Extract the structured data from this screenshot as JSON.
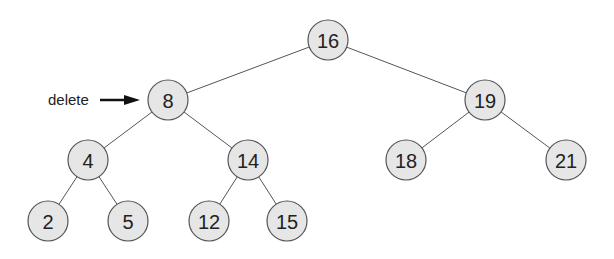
{
  "diagram": {
    "type": "binary-search-tree",
    "node_radius": 20,
    "colors": {
      "node_fill": "#e6e6e6",
      "node_stroke": "#555555",
      "edge": "#555555",
      "text": "#222222",
      "arrow": "#111111"
    },
    "nodes": [
      {
        "id": "n16",
        "label": "16",
        "x": 328,
        "y": 40
      },
      {
        "id": "n8",
        "label": "8",
        "x": 168,
        "y": 100
      },
      {
        "id": "n19",
        "label": "19",
        "x": 485,
        "y": 100
      },
      {
        "id": "n4",
        "label": "4",
        "x": 88,
        "y": 160
      },
      {
        "id": "n14",
        "label": "14",
        "x": 248,
        "y": 160
      },
      {
        "id": "n18",
        "label": "18",
        "x": 406,
        "y": 160
      },
      {
        "id": "n21",
        "label": "21",
        "x": 566,
        "y": 160
      },
      {
        "id": "n2",
        "label": "2",
        "x": 48,
        "y": 221
      },
      {
        "id": "n5",
        "label": "5",
        "x": 128,
        "y": 221
      },
      {
        "id": "n12",
        "label": "12",
        "x": 209,
        "y": 221
      },
      {
        "id": "n15",
        "label": "15",
        "x": 287,
        "y": 221
      }
    ],
    "edges": [
      [
        "n16",
        "n8"
      ],
      [
        "n16",
        "n19"
      ],
      [
        "n8",
        "n4"
      ],
      [
        "n8",
        "n14"
      ],
      [
        "n19",
        "n18"
      ],
      [
        "n19",
        "n21"
      ],
      [
        "n4",
        "n2"
      ],
      [
        "n4",
        "n5"
      ],
      [
        "n14",
        "n12"
      ],
      [
        "n14",
        "n15"
      ]
    ],
    "annotation": {
      "text": "delete",
      "target": "n8",
      "text_x": 48,
      "text_y": 105,
      "arrow_x1": 100,
      "arrow_x2": 140,
      "arrow_y": 100
    }
  }
}
